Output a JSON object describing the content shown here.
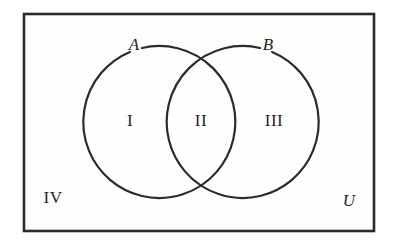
{
  "figure": {
    "kind": "venn-diagram",
    "background_color": "#ffffff",
    "stroke_color": "#2b2b2b",
    "interior_color": "#fefefe"
  },
  "universe": {
    "label": "U",
    "outside_region_label": "IV"
  },
  "sets": [
    {
      "id": "A",
      "label": "A",
      "cx": 152,
      "cy": 123,
      "r": 76
    },
    {
      "id": "B",
      "label": "B",
      "cx": 250,
      "cy": 123,
      "r": 76
    }
  ],
  "regions": [
    {
      "id": "I",
      "label": "I",
      "meaning": "A only",
      "x": 130,
      "y": 122
    },
    {
      "id": "II",
      "label": "II",
      "meaning": "A and B",
      "x": 201,
      "y": 122
    },
    {
      "id": "III",
      "label": "III",
      "meaning": "B only",
      "x": 274,
      "y": 122
    },
    {
      "id": "IV",
      "label": "IV",
      "meaning": "outside A and B",
      "x": 53,
      "y": 199
    }
  ],
  "frame": {
    "x": 24,
    "y": 14,
    "width": 350,
    "height": 217
  },
  "universe_label_position": {
    "x": 349,
    "y": 202
  }
}
